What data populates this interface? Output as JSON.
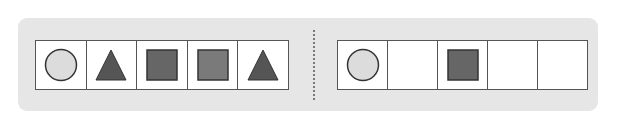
{
  "colors": {
    "panel_bg": "#e6e6e6",
    "cell_border": "#555555",
    "circle_fill": "#dcdcdc",
    "triangle_fill": "#555555",
    "square_dark_fill": "#666666",
    "square_light_fill": "#7a7a7a"
  },
  "pattern": {
    "cells": [
      "circle",
      "triangle",
      "square-dark",
      "square-light",
      "triangle"
    ]
  },
  "answer": {
    "cells": [
      "circle",
      "empty",
      "square-dark",
      "empty",
      "empty"
    ]
  }
}
